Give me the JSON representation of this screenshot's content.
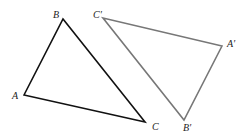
{
  "diagram": {
    "type": "congruent-triangles",
    "triangles": [
      {
        "name": "triangle-ABC",
        "stroke": "#111111",
        "vertices": [
          {
            "label": "A",
            "x": 24,
            "y": 95,
            "lx": 12,
            "ly": 99
          },
          {
            "label": "B",
            "x": 63,
            "y": 19,
            "lx": 53,
            "ly": 18
          },
          {
            "label": "C",
            "x": 145,
            "y": 122,
            "lx": 152,
            "ly": 130
          }
        ]
      },
      {
        "name": "triangle-A'B'C'",
        "stroke": "#777777",
        "vertices": [
          {
            "label": "A′",
            "x": 222,
            "y": 46,
            "lx": 227,
            "ly": 47
          },
          {
            "label": "B′",
            "x": 184,
            "y": 120,
            "lx": 183,
            "ly": 131
          },
          {
            "label": "C′",
            "x": 103,
            "y": 18,
            "lx": 93,
            "ly": 18
          }
        ]
      }
    ]
  }
}
